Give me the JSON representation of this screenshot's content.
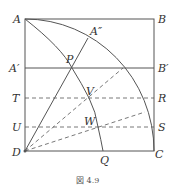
{
  "figure": {
    "caption": "図 4.9",
    "points": {
      "A": "A",
      "B": "B",
      "A1": "A′",
      "B1": "B′",
      "A2": "A″",
      "P": "P",
      "T": "T",
      "R": "R",
      "V": "V",
      "U": "U",
      "S": "S",
      "W": "W",
      "D": "D",
      "Q": "Q",
      "C": "C"
    },
    "colors": {
      "line": "#555555",
      "background": "#ffffff"
    }
  }
}
